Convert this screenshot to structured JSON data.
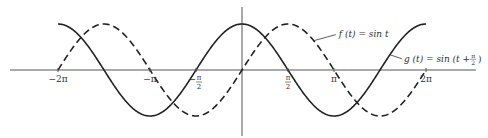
{
  "chart_data": {
    "type": "line",
    "title": "",
    "xlabel": "",
    "ylabel": "",
    "xlim": [
      -7.0,
      7.4
    ],
    "ylim": [
      -1,
      1
    ],
    "grid": false,
    "x_ticks": [
      {
        "value": -6.2832,
        "label": "−2π"
      },
      {
        "value": -3.1416,
        "label": "−π"
      },
      {
        "value": -1.5708,
        "label": "−π/2"
      },
      {
        "value": 1.5708,
        "label": "π/2"
      },
      {
        "value": 3.1416,
        "label": "π"
      },
      {
        "value": 6.2832,
        "label": "2π"
      }
    ],
    "series": [
      {
        "name": "f(t) = sin t",
        "function": "sin(t)",
        "style": "dashed",
        "domain": [
          -6.2832,
          6.2832
        ],
        "color": "#222222"
      },
      {
        "name": "g(t) = sin(t + π/2)",
        "function": "sin(t + pi/2)",
        "style": "solid",
        "domain": [
          -6.2832,
          6.2832
        ],
        "color": "#222222"
      }
    ],
    "annotations": [
      {
        "text": "f (t) = sin t",
        "points_to": "dashed curve"
      },
      {
        "text": "g (t) = sin (t + π/2)",
        "points_to": "solid curve"
      }
    ]
  },
  "labels": {
    "f": "f (t) = sin t",
    "g_prefix": "g (t) = sin (t + ",
    "g_frac_num": "π",
    "g_frac_den": "2",
    "g_suffix": ")"
  }
}
